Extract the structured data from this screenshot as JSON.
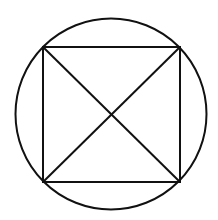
{
  "diagram": {
    "title": "",
    "stroke_color": "#111111",
    "background": "#ffffff",
    "stroke_width": 2,
    "circle": {
      "cx": 111,
      "cy": 114,
      "r": 95.5
    },
    "square": {
      "corners": [
        {
          "label": "",
          "x": 43,
          "y": 47
        },
        {
          "label": "",
          "x": 180,
          "y": 47
        },
        {
          "label": "",
          "x": 180,
          "y": 182
        },
        {
          "label": "",
          "x": 43,
          "y": 182
        }
      ]
    },
    "diagonals": [
      {
        "x1": 43,
        "y1": 47,
        "x2": 180,
        "y2": 182
      },
      {
        "x1": 180,
        "y1": 47,
        "x2": 43,
        "y2": 182
      }
    ],
    "intersection": {
      "x": 111,
      "y": 114
    }
  }
}
